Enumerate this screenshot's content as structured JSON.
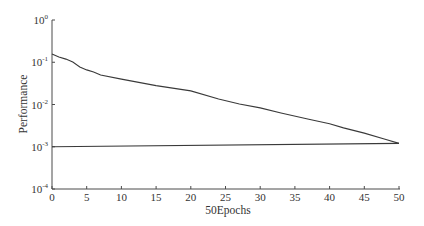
{
  "chart_data": {
    "type": "line",
    "title": "",
    "xlabel": "50Epochs",
    "ylabel": "Performance",
    "xscale": "linear",
    "yscale": "log",
    "xlim": [
      0,
      50
    ],
    "ylim": [
      0.0001,
      1
    ],
    "grid": false,
    "legend": null,
    "xticks": [
      0,
      5,
      10,
      15,
      20,
      25,
      30,
      35,
      40,
      45,
      50
    ],
    "xtick_labels": [
      "0",
      "5",
      "10",
      "15",
      "20",
      "25",
      "30",
      "35",
      "40",
      "45",
      "50"
    ],
    "yticks": [
      1,
      0.1,
      0.01,
      0.001,
      0.0001
    ],
    "ytick_labels": [
      {
        "base": "10",
        "exp": "0"
      },
      {
        "base": "10",
        "exp": "-1"
      },
      {
        "base": "10",
        "exp": "-2"
      },
      {
        "base": "10",
        "exp": "-3"
      },
      {
        "base": "10",
        "exp": "-4"
      }
    ],
    "series": [
      {
        "name": "training",
        "x": [
          0,
          1,
          2,
          3,
          4,
          5,
          6,
          7,
          10,
          15,
          20,
          24,
          27,
          30,
          33,
          37,
          40,
          42,
          45,
          48,
          50
        ],
        "values": [
          0.157,
          0.133,
          0.119,
          0.101,
          0.077,
          0.066,
          0.059,
          0.05,
          0.04,
          0.028,
          0.021,
          0.0135,
          0.0103,
          0.0083,
          0.0063,
          0.0045,
          0.0035,
          0.0028,
          0.0021,
          0.0015,
          0.0012
        ]
      },
      {
        "name": "goal",
        "x": [
          0,
          50
        ],
        "values": [
          0.001,
          0.0012
        ]
      }
    ]
  }
}
